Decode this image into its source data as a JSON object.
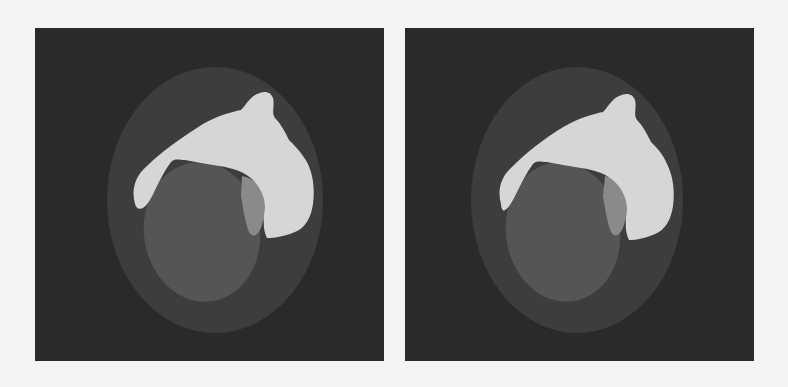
{
  "figure": {
    "panels": [
      {
        "id": "left",
        "description": "Segmentation result (left)",
        "colors": {
          "background": "#2a2a2a",
          "outer_region": "#3d3d3d",
          "inner_region": "#555555",
          "bright_region": "#d6d6d6",
          "mid_region": "#8a8a8a"
        }
      },
      {
        "id": "right",
        "description": "Segmentation result (right)",
        "colors": {
          "background": "#2a2a2a",
          "outer_region": "#3d3d3d",
          "inner_region": "#555555",
          "bright_region": "#d6d6d6",
          "mid_region": "#8a8a8a"
        }
      }
    ]
  }
}
